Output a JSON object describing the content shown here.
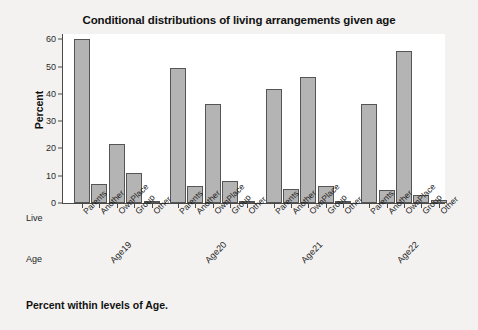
{
  "chart_data": {
    "type": "bar",
    "title": "Conditional distributions of living arrangements given age",
    "xlabel": "",
    "ylabel": "Percent",
    "ylim": [
      0,
      62
    ],
    "yticks": [
      0,
      10,
      20,
      30,
      40,
      50,
      60
    ],
    "grid": false,
    "legend": "none",
    "categories": [
      "Parents",
      "Another",
      "OwnPlace",
      "Group",
      "Other"
    ],
    "groups": [
      "Age19",
      "Age20",
      "Age21",
      "Age22"
    ],
    "group_axis_label": "Age",
    "category_axis_label": "Live",
    "bar_color": "#b4b4b4",
    "bar_edge_color": "#555555",
    "series": [
      {
        "name": "Age19",
        "categories": [
          "Parents",
          "Another",
          "OwnPlace",
          "Group",
          "Other"
        ],
        "values": [
          60.0,
          7.0,
          21.5,
          11.0,
          0.7
        ]
      },
      {
        "name": "Age20",
        "categories": [
          "Parents",
          "Another",
          "OwnPlace",
          "Group",
          "Other"
        ],
        "values": [
          49.5,
          6.3,
          36.2,
          8.0,
          0.4
        ]
      },
      {
        "name": "Age21",
        "categories": [
          "Parents",
          "Another",
          "OwnPlace",
          "Group",
          "Other"
        ],
        "values": [
          42.0,
          5.2,
          46.4,
          6.3,
          0.5
        ]
      },
      {
        "name": "Age22",
        "categories": [
          "Parents",
          "Another",
          "OwnPlace",
          "Group",
          "Other"
        ],
        "values": [
          36.2,
          4.7,
          55.8,
          2.8,
          1.2
        ]
      }
    ],
    "footnote": "Percent within levels of Age."
  },
  "page": {
    "background": "#f3f2f0",
    "panel_background": "#ffffff",
    "axis_color": "#4a4a4a"
  }
}
